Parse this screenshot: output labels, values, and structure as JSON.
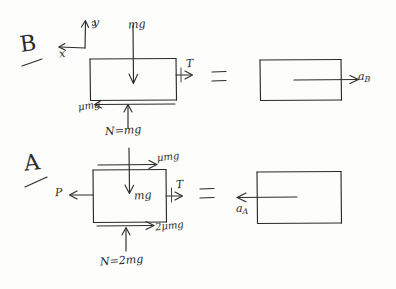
{
  "figure": {
    "title_hidden": "",
    "style": "hand-drawn free-body diagram",
    "ink_color": "#2b2b2b",
    "paper_color": "#fdfdfb"
  },
  "axes": {
    "y_label": "y",
    "x_label": "x",
    "y_direction": "up",
    "x_direction": "left"
  },
  "case_b": {
    "case_label": "B",
    "fbd": {
      "weight_label": "mg",
      "tension_label": "T",
      "friction_label": "μmg",
      "normal_label": "N=mg",
      "weight_direction": "down",
      "tension_direction": "right",
      "friction_direction": "left",
      "normal_direction": "up"
    },
    "equals": "=",
    "result": {
      "accel_label": "a",
      "accel_subscript": "B",
      "accel_direction": "right"
    }
  },
  "case_a": {
    "case_label": "A",
    "fbd": {
      "applied_label": "P",
      "top_friction_label": "μmg",
      "weight_label": "mg",
      "tension_label": "T",
      "bottom_friction_label": "2μmg",
      "normal_label": "N=2mg",
      "applied_direction": "left",
      "top_friction_direction": "right",
      "weight_direction": "down",
      "tension_direction": "right",
      "bottom_friction_direction": "right",
      "normal_direction": "up"
    },
    "equals": "=",
    "result": {
      "accel_label": "a",
      "accel_subscript": "A",
      "accel_direction": "left"
    }
  }
}
